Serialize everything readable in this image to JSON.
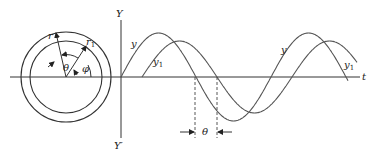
{
  "diagram": {
    "phasor": {
      "radius_label": "r",
      "radius1_label": "r",
      "radius1_sub": "1",
      "theta_label": "θ",
      "phi_label": "φ"
    },
    "axes": {
      "y_top_label": "Y",
      "y_bottom_label": "Y′",
      "t_label": "t"
    },
    "curves": {
      "y_label": "y",
      "y1_label": "y",
      "y1_sub": "1"
    },
    "phase_marker": {
      "label": "θ"
    }
  }
}
